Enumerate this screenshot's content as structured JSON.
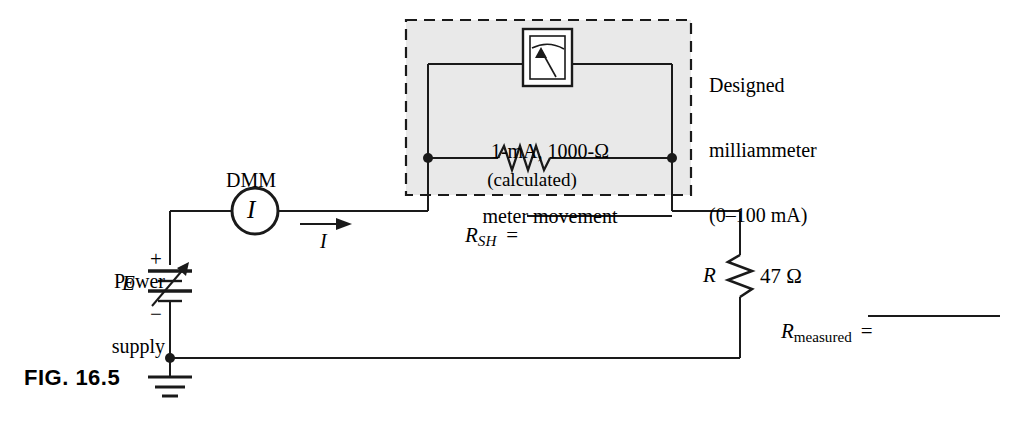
{
  "figure": {
    "id_label": "FIG. 16.5",
    "caption_note": ""
  },
  "labels": {
    "designed_meter": {
      "line1": "Designed",
      "line2": "milliammeter",
      "line3": "(0–100 mA)"
    },
    "meter_movement": {
      "line1": "1-mA, 1000-Ω",
      "line2": "meter movement"
    },
    "shunt_note": "(calculated)",
    "shunt_symbol": "R",
    "shunt_subscript": "SH",
    "shunt_equals": "=",
    "dmm": "DMM",
    "dmm_symbol": "I",
    "current_symbol": "I",
    "power_supply": {
      "line1": "Power",
      "line2": "supply"
    },
    "source_symbol": "E",
    "plus_sign": "+",
    "minus_sign": "−",
    "resistor_symbol": "R",
    "resistor_value": "47 Ω",
    "measured_symbol": "R",
    "measured_subscript": "measured",
    "measured_equals": "="
  },
  "blanks": {
    "shunt_blank": "",
    "measured_blank": ""
  },
  "colors": {
    "ink": "#000000",
    "paper": "#ffffff",
    "shaded_box": "#e8e8e8",
    "dash_border": "#1a1a1a"
  },
  "icons": {
    "ground": "ground-symbol",
    "battery": "variable-dc-source",
    "ammeter": "analog-meter-movement",
    "resistor": "zigzag-resistor",
    "node": "junction-dot",
    "arrow": "current-direction-arrow"
  }
}
